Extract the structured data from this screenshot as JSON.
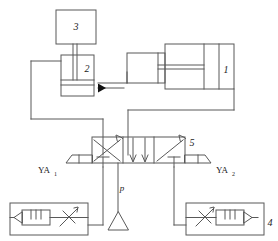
{
  "diagram": {
    "type": "hydraulic-circuit",
    "line_color": "#595959",
    "accent_color": "#000000",
    "background_color": "#ffffff",
    "components": [
      {
        "id": "1",
        "label": "1",
        "name": "main-hydraulic-cylinder",
        "kind": "double-acting-cylinder",
        "label_x": 216,
        "label_y": 72
      },
      {
        "id": "2",
        "label": "2",
        "name": "secondary-cylinder",
        "kind": "cylinder",
        "label_x": 88,
        "label_y": 70
      },
      {
        "id": "3",
        "label": "3",
        "name": "load-block",
        "kind": "mass-block",
        "label_x": 76,
        "label_y": 27
      },
      {
        "id": "4",
        "label": "4",
        "name": "throttle-check-valve-right",
        "kind": "one-way-throttle-valve",
        "label_x": 268,
        "label_y": 224
      },
      {
        "id": "5",
        "label": "5",
        "name": "directional-control-valve",
        "kind": "three-position-four-way-valve",
        "label_x": 190,
        "label_y": 145
      }
    ],
    "labels": [
      {
        "name": "solenoid-label-left",
        "text": "YA",
        "sub": "1",
        "x": 40,
        "y": 172
      },
      {
        "name": "solenoid-label-right",
        "text": "YA",
        "sub": "2",
        "x": 211,
        "y": 172
      },
      {
        "name": "pressure-port-label",
        "text": "p",
        "x": 122,
        "y": 190
      }
    ]
  }
}
